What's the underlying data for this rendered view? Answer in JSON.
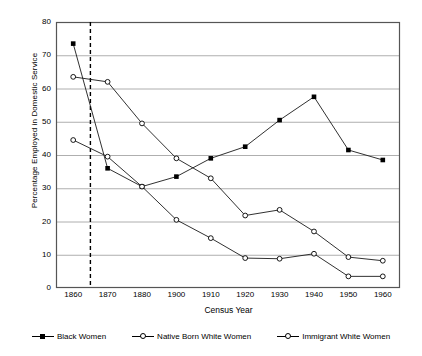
{
  "chart_data": {
    "type": "line",
    "title": "",
    "xlabel": "Census Year",
    "ylabel": "Percentage Employed in Domestic Service",
    "categories": [
      "1860",
      "1870",
      "1880",
      "1900",
      "1910",
      "1920",
      "1930",
      "1940",
      "1950",
      "1960"
    ],
    "ylim": [
      0,
      80
    ],
    "yticks": [
      "0",
      "10",
      "20",
      "30",
      "40",
      "50",
      "60",
      "70",
      "80"
    ],
    "grid": "horizontal",
    "legend_position": "bottom",
    "annotations": [
      {
        "name": "emancipation-line",
        "type": "vertical-dashed-line",
        "x_value": "1863",
        "label": ""
      }
    ],
    "series": [
      {
        "name": "Black Women",
        "marker": "filled-square",
        "values": [
          73.5,
          36.0,
          30.5,
          33.5,
          39.0,
          42.5,
          50.5,
          57.5,
          41.5,
          38.5
        ]
      },
      {
        "name": "Native Born White Women",
        "marker": "open-circle",
        "values": [
          44.5,
          39.5,
          30.5,
          20.5,
          15.0,
          9.0,
          8.8,
          10.3,
          3.5,
          3.5
        ]
      },
      {
        "name": "Immigrant White Women",
        "marker": "open-circle",
        "values": [
          63.5,
          62.0,
          49.5,
          39.0,
          33.0,
          21.8,
          23.5,
          17.0,
          9.3,
          8.2
        ]
      }
    ]
  }
}
